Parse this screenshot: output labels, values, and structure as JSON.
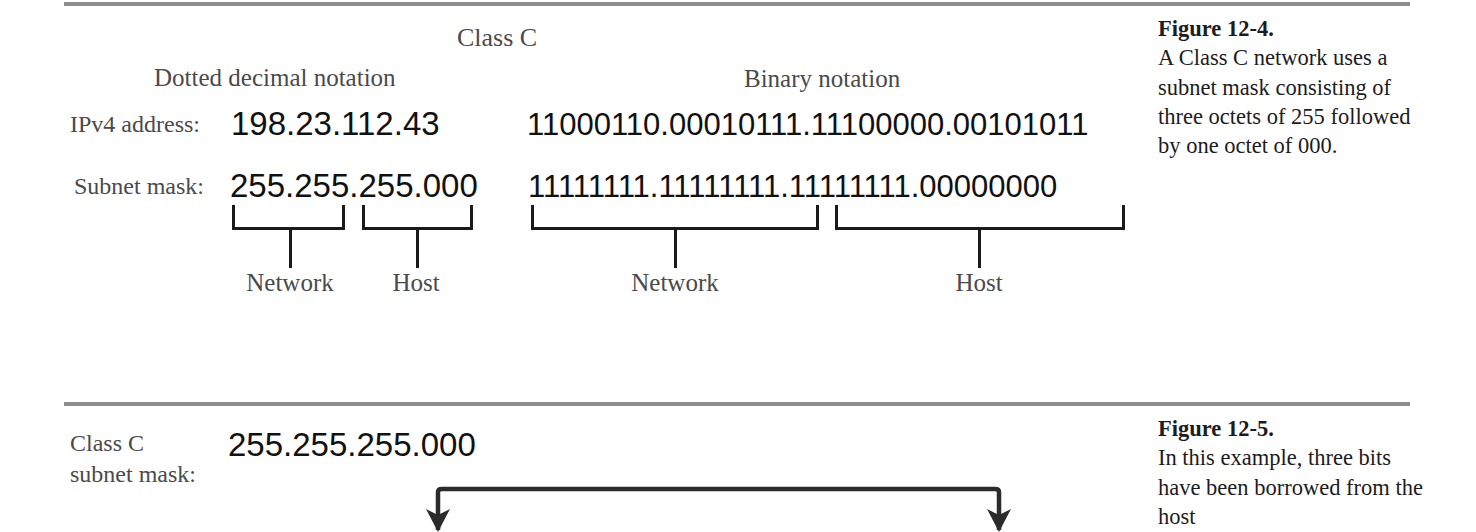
{
  "figure_12_4": {
    "title": "Class C",
    "columns": {
      "dotted_decimal": "Dotted decimal notation",
      "binary": "Binary notation"
    },
    "rows": [
      {
        "label": "IPv4 address:",
        "dotted_decimal": "198.23.112.43",
        "binary": "11000110.00010111.11100000.00101011"
      },
      {
        "label": "Subnet mask:",
        "dotted_decimal": "255.255.255.000",
        "binary": "11111111.11111111.11111111.00000000"
      }
    ],
    "brackets": {
      "decimal_network": "Network",
      "decimal_host": "Host",
      "binary_network": "Network",
      "binary_host": "Host"
    },
    "caption": {
      "heading": "Figure 12-4.",
      "body": "A Class C network uses a subnet mask consisting of three octets of 255 followed by one octet of 000."
    }
  },
  "figure_12_5": {
    "row_label_line1": "Class C",
    "row_label_line2": "subnet mask:",
    "mask_value": "255.255.255.000",
    "caption": {
      "heading": "Figure 12-5.",
      "body": "In this example, three bits have been borrowed from the host"
    }
  },
  "colors": {
    "rule": "#8d8d8d",
    "ink": "#1a1a1a",
    "label_gray": "#4a4a4a"
  }
}
